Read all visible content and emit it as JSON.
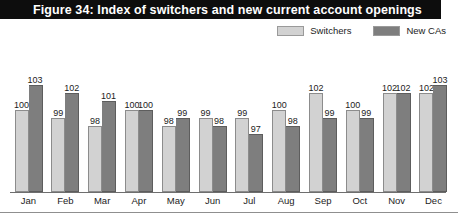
{
  "figure": {
    "title": "Figure 34: Index of switchers and new current account openings"
  },
  "legend": {
    "items": [
      {
        "label": "Switchers",
        "color": "#d2d2d2"
      },
      {
        "label": "New CAs",
        "color": "#7e7e7e"
      }
    ]
  },
  "colors": {
    "banner": "#0d0d0d",
    "switchers": "#d2d2d2",
    "new_cas": "#7e7e7e",
    "axis": "#6e6e6e"
  },
  "chart_data": {
    "type": "bar",
    "title": "Figure 34: Index of switchers and new current account openings",
    "xlabel": "",
    "ylabel": "",
    "ylim": [
      90,
      106
    ],
    "grid": false,
    "legend_position": "top-right",
    "categories": [
      "Jan",
      "Feb",
      "Mar",
      "Apr",
      "May",
      "Jun",
      "Jul",
      "Aug",
      "Sep",
      "Oct",
      "Nov",
      "Dec"
    ],
    "series": [
      {
        "name": "Switchers",
        "color": "#d2d2d2",
        "values": [
          100,
          99,
          98,
          100,
          98,
          99,
          99,
          100,
          102,
          100,
          102,
          102
        ]
      },
      {
        "name": "New CAs",
        "color": "#7e7e7e",
        "values": [
          103,
          102,
          101,
          100,
          99,
          98,
          97,
          98,
          99,
          99,
          102,
          103
        ]
      }
    ]
  }
}
